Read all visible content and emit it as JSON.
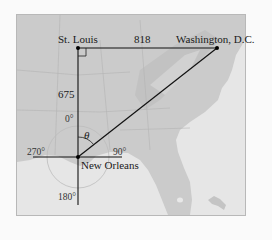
{
  "diagram": {
    "type": "map-triangle",
    "cities": {
      "st_louis": "St. Louis",
      "washington": "Washington, D.C.",
      "new_orleans": "New Orleans"
    },
    "distances": {
      "st_louis_to_washington": "818",
      "st_louis_to_new_orleans": "675"
    },
    "angle_symbol": "θ",
    "bearings": {
      "north": "0°",
      "east": "90°",
      "south": "180°",
      "west": "270°"
    },
    "colors": {
      "land": "#cfcfcf",
      "water": "#e6e6e6",
      "lines": "#111111",
      "compass_circle": "#bdbdbd"
    }
  }
}
